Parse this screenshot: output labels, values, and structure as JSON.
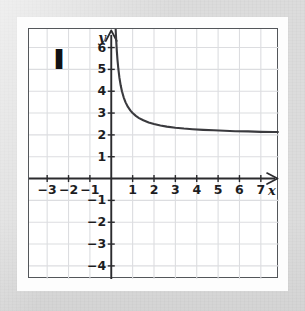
{
  "figure": {
    "label": "I",
    "label_position": {
      "x": -2.45,
      "y": 5.45
    }
  },
  "chart_data": {
    "type": "line",
    "title": "",
    "xlabel": "x",
    "ylabel": "y",
    "xlim": [
      -3.85,
      7.85
    ],
    "ylim": [
      -4.6,
      6.85
    ],
    "grid": true,
    "grid_spacing": 1,
    "legend": "none",
    "axis_arrows": {
      "x_positive": true,
      "y_positive": true
    },
    "x_ticks": [
      -3,
      -2,
      -1,
      1,
      2,
      3,
      4,
      5,
      6,
      7
    ],
    "x_tick_labels": [
      "−3",
      "−2",
      "−1",
      "1",
      "2",
      "3",
      "4",
      "5",
      "6",
      "7"
    ],
    "y_ticks": [
      -4,
      -3,
      -2,
      -1,
      1,
      2,
      3,
      4,
      5,
      6
    ],
    "y_tick_labels": [
      "−4",
      "−3",
      "−2",
      "−1",
      "1",
      "2",
      "3",
      "4",
      "5",
      "6"
    ],
    "series": [
      {
        "name": "curve",
        "equation": "y = 1/x + 2",
        "asymptote_horizontal": 2,
        "asymptote_vertical": 0,
        "color": "#3a3a3e",
        "x": [
          0.148,
          0.16,
          0.175,
          0.19,
          0.21,
          0.23,
          0.26,
          0.29,
          0.33,
          0.38,
          0.44,
          0.5,
          0.58,
          0.67,
          0.78,
          0.9,
          1.0,
          1.15,
          1.3,
          1.5,
          1.75,
          2.0,
          2.3,
          2.6,
          3.0,
          3.4,
          3.8,
          4.3,
          4.8,
          5.3,
          5.8,
          6.4,
          7.0,
          7.6,
          7.8
        ],
        "y": [
          8.76,
          8.25,
          7.71,
          7.26,
          6.76,
          6.35,
          5.85,
          5.45,
          5.03,
          4.63,
          4.27,
          4.0,
          3.72,
          3.49,
          3.28,
          3.11,
          3.0,
          2.87,
          2.77,
          2.67,
          2.57,
          2.5,
          2.43,
          2.38,
          2.33,
          2.29,
          2.26,
          2.23,
          2.21,
          2.19,
          2.17,
          2.16,
          2.14,
          2.13,
          2.13
        ]
      }
    ]
  },
  "colors": {
    "curve": "#3a3a3e",
    "axis": "#2b2b2e",
    "grid": "#dcdde0",
    "frame": "#53565a",
    "background": "#ffffff",
    "paper": "#dcdcdc"
  }
}
